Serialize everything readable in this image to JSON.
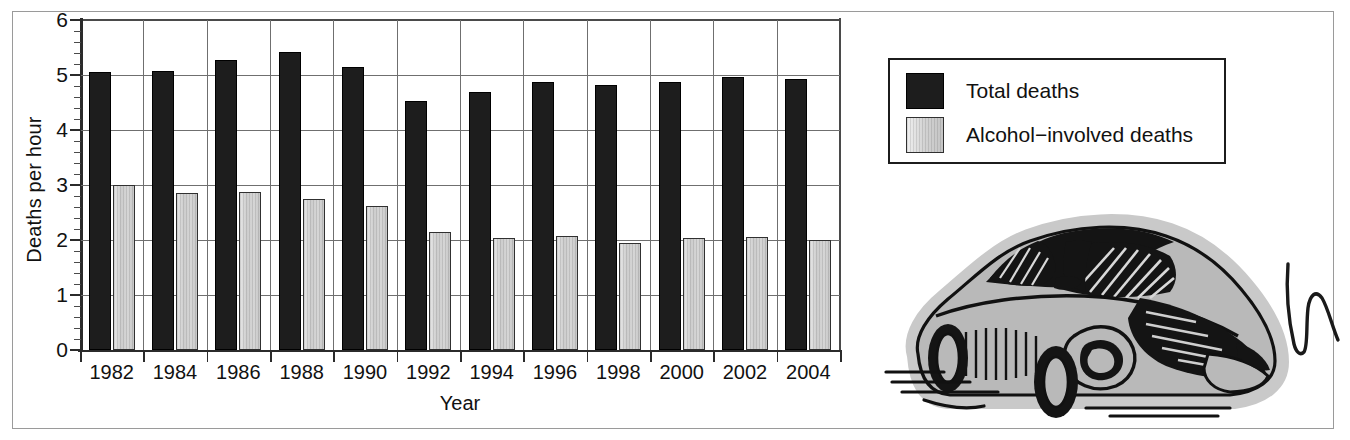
{
  "figure": {
    "y_axis_title": "Deaths per hour",
    "x_axis_title": "Year"
  },
  "legend": {
    "items": [
      {
        "label": "Total deaths",
        "swatch": "black-solid-swatch",
        "color": "#1d1d1d"
      },
      {
        "label": "Alcohol−involved deaths",
        "swatch": "gray-gradient-swatch",
        "color": "#d2d2d2"
      }
    ]
  },
  "illustration": {
    "name": "crashed-car-clipart",
    "description": "Line-art illustration of a damaged car with crumpled front end"
  },
  "chart_data": {
    "type": "bar",
    "title": "",
    "xlabel": "Year",
    "ylabel": "Deaths per hour",
    "categories": [
      "1982",
      "1984",
      "1986",
      "1988",
      "1990",
      "1992",
      "1994",
      "1996",
      "1998",
      "2000",
      "2002",
      "2004"
    ],
    "series": [
      {
        "name": "Total deaths",
        "color": "#1d1d1d",
        "values": [
          5.05,
          5.07,
          5.28,
          5.42,
          5.14,
          4.52,
          4.7,
          4.87,
          4.81,
          4.87,
          4.97,
          4.93
        ]
      },
      {
        "name": "Alcohol−involved deaths",
        "color": "#d2d2d2",
        "values": [
          3.0,
          2.85,
          2.88,
          2.75,
          2.62,
          2.14,
          2.03,
          2.07,
          1.95,
          2.04,
          2.06,
          2.0
        ]
      }
    ],
    "ylim": [
      0,
      6
    ],
    "ytick_labels": [
      "0",
      "1",
      "2",
      "3",
      "4",
      "5",
      "6"
    ],
    "ytick_values": [
      0,
      1,
      2,
      3,
      4,
      5,
      6
    ],
    "yminor_step": 0.2,
    "grid": "both",
    "legend_position": "right"
  }
}
